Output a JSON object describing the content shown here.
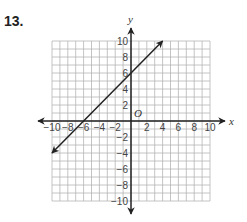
{
  "problem": {
    "number": "13."
  },
  "chart_data": {
    "type": "line",
    "title": "",
    "xlabel": "x",
    "ylabel": "y",
    "origin_label": "O",
    "xlim": [
      -10,
      10
    ],
    "ylim": [
      -10,
      10
    ],
    "grid": true,
    "grid_step": 1,
    "x_tick_labels": [
      "-10",
      "-8",
      "-6",
      "-4",
      "-2",
      "2",
      "4",
      "6",
      "8",
      "10"
    ],
    "y_tick_labels": [
      "10",
      "8",
      "6",
      "4",
      "2",
      "-2",
      "-4",
      "-6",
      "-8",
      "-10"
    ],
    "series": [
      {
        "name": "line",
        "equation": "y = x + 6",
        "slope": 1,
        "y_intercept": 6,
        "x_intercept": -6,
        "x": [
          -10,
          4
        ],
        "y": [
          -4,
          10
        ],
        "arrows_both_ends": true
      }
    ]
  },
  "colors": {
    "grid": "#b5b5b5",
    "axis": "#222222",
    "line": "#222222"
  }
}
